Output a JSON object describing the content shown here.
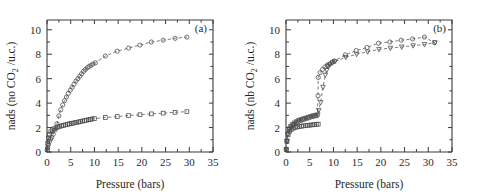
{
  "figure": {
    "panels": [
      {
        "tag": "(a)",
        "xlabel": "Pressure (bars)",
        "ylabel_main": "nads (no CO",
        "ylabel_sub": "2",
        "ylabel_tail": " /u.c.)"
      },
      {
        "tag": "(b)",
        "xlabel": "Pressure (bars)",
        "ylabel_main": "nads (nb CO",
        "ylabel_sub": "2",
        "ylabel_tail": " /u.c.)"
      }
    ],
    "xticks": [
      "0",
      "5",
      "10",
      "15",
      "20",
      "25",
      "30",
      "35"
    ],
    "yticks": [
      "0",
      "2",
      "4",
      "6",
      "8",
      "10"
    ]
  },
  "chart_data": [
    {
      "type": "scatter",
      "panel": "(a)",
      "title": "",
      "xlabel": "Pressure (bars)",
      "ylabel": "nads (no CO2 /u.c.)",
      "xlim": [
        0,
        35
      ],
      "ylim": [
        0,
        10.8
      ],
      "xticks": [
        0,
        5,
        10,
        15,
        20,
        25,
        30,
        35
      ],
      "yticks": [
        0,
        2,
        4,
        6,
        8,
        10
      ],
      "grid": false,
      "legend": null,
      "annotations": [
        "(a)"
      ],
      "series": [
        {
          "name": "circles-upper",
          "marker": "circle",
          "line": "dashed",
          "x": [
            0.05,
            0.15,
            0.3,
            0.5,
            0.75,
            1.0,
            1.3,
            1.7,
            2.1,
            2.5,
            2.9,
            3.3,
            3.7,
            4.1,
            4.5,
            4.9,
            5.3,
            5.7,
            6.1,
            6.5,
            6.9,
            7.3,
            7.7,
            8.1,
            8.5,
            8.9,
            9.3,
            9.7,
            10.2,
            12.3,
            14.8,
            17.2,
            19.6,
            22.0,
            24.5,
            27.0,
            29.5
          ],
          "y": [
            0.15,
            0.35,
            0.6,
            0.85,
            1.05,
            1.2,
            1.45,
            1.8,
            2.3,
            2.95,
            3.45,
            3.85,
            4.2,
            4.5,
            4.8,
            5.05,
            5.3,
            5.55,
            5.8,
            6.0,
            6.2,
            6.4,
            6.6,
            6.75,
            6.9,
            7.0,
            7.1,
            7.2,
            7.3,
            7.85,
            8.25,
            8.5,
            8.75,
            9.0,
            9.15,
            9.3,
            9.4
          ]
        },
        {
          "name": "squares-lower",
          "marker": "square",
          "line": "dashed",
          "x": [
            0.05,
            0.15,
            0.3,
            0.5,
            0.8,
            1.1,
            1.5,
            1.9,
            2.3,
            2.7,
            3.1,
            3.5,
            3.9,
            4.3,
            4.7,
            5.1,
            5.5,
            5.9,
            6.3,
            6.7,
            7.1,
            7.5,
            7.9,
            8.3,
            8.7,
            9.1,
            9.5,
            10.0,
            12.3,
            14.8,
            17.2,
            19.6,
            22.0,
            24.5,
            27.0,
            29.5
          ],
          "y": [
            0.2,
            0.7,
            1.15,
            1.45,
            1.65,
            1.8,
            1.9,
            1.98,
            2.05,
            2.1,
            2.14,
            2.18,
            2.22,
            2.26,
            2.3,
            2.33,
            2.36,
            2.4,
            2.43,
            2.46,
            2.5,
            2.53,
            2.56,
            2.6,
            2.63,
            2.66,
            2.7,
            2.73,
            2.82,
            2.9,
            2.98,
            3.05,
            3.12,
            3.18,
            3.25,
            3.3
          ]
        }
      ]
    },
    {
      "type": "scatter",
      "panel": "(b)",
      "title": "",
      "xlabel": "Pressure (bars)",
      "ylabel": "nads (nb CO2 /u.c.)",
      "xlim": [
        0,
        35
      ],
      "ylim": [
        0,
        10.8
      ],
      "xticks": [
        0,
        5,
        10,
        15,
        20,
        25,
        30,
        35
      ],
      "yticks": [
        0,
        2,
        4,
        6,
        8,
        10
      ],
      "grid": false,
      "legend": null,
      "annotations": [
        "(b)"
      ],
      "series": [
        {
          "name": "circles-adsorption",
          "marker": "circle",
          "line": "dashed",
          "x": [
            0.05,
            0.2,
            0.4,
            0.7,
            1.0,
            1.4,
            1.8,
            2.2,
            2.7,
            3.2,
            3.7,
            4.2,
            4.7,
            5.2,
            5.7,
            6.2,
            6.6,
            6.75,
            6.8,
            7.2,
            7.7,
            8.2,
            8.7,
            9.2,
            9.7,
            10.2,
            12.5,
            14.8,
            17.1,
            19.5,
            21.9,
            24.3,
            26.7,
            29.2,
            31.3
          ],
          "y": [
            0.2,
            0.9,
            1.5,
            1.85,
            2.05,
            2.2,
            2.3,
            2.4,
            2.5,
            2.58,
            2.65,
            2.72,
            2.78,
            2.85,
            2.9,
            2.95,
            3.0,
            4.6,
            6.1,
            6.5,
            6.75,
            6.95,
            7.1,
            7.2,
            7.35,
            7.45,
            7.95,
            8.3,
            8.55,
            8.9,
            9.0,
            9.15,
            9.25,
            9.4,
            8.95
          ]
        },
        {
          "name": "triangles-desorption",
          "marker": "triangle-down",
          "line": "dashed",
          "x": [
            0.05,
            0.2,
            0.4,
            0.7,
            1.0,
            1.4,
            1.8,
            2.2,
            2.7,
            3.2,
            3.7,
            4.2,
            4.7,
            5.2,
            5.7,
            6.2,
            6.7,
            6.9,
            7.3,
            7.8,
            8.3,
            8.6,
            8.9,
            9.3,
            9.8,
            10.3,
            12.6,
            14.9,
            17.2,
            19.6,
            22.0,
            24.4,
            26.8,
            29.2,
            31.4
          ],
          "y": [
            0.2,
            0.9,
            1.5,
            1.9,
            2.1,
            2.25,
            2.38,
            2.48,
            2.58,
            2.66,
            2.72,
            2.78,
            2.84,
            2.9,
            2.96,
            3.0,
            3.05,
            3.4,
            4.05,
            5.3,
            6.3,
            6.7,
            7.0,
            7.15,
            7.3,
            7.4,
            7.75,
            8.0,
            8.2,
            8.4,
            8.5,
            8.6,
            8.7,
            8.8,
            8.95
          ]
        },
        {
          "name": "squares-lower",
          "marker": "square",
          "line": "dashed",
          "x": [
            0.05,
            0.2,
            0.45,
            0.75,
            1.1,
            1.5,
            1.9,
            2.35,
            2.8,
            3.25,
            3.7,
            4.15,
            4.6,
            5.05,
            5.5,
            5.95,
            6.4,
            6.8
          ],
          "y": [
            0.2,
            0.85,
            1.4,
            1.7,
            1.85,
            1.95,
            2.0,
            2.05,
            2.08,
            2.11,
            2.14,
            2.16,
            2.18,
            2.2,
            2.22,
            2.24,
            2.26,
            2.28
          ]
        }
      ]
    }
  ]
}
